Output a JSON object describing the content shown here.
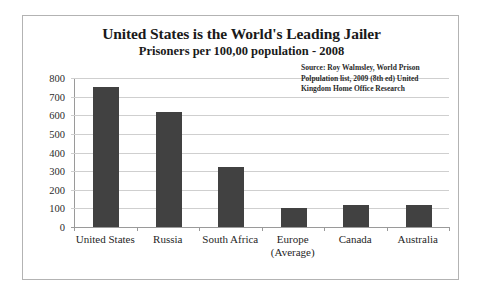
{
  "chart_data": {
    "type": "bar",
    "title": "United States is the World's Leading Jailer",
    "subtitle": "Prisoners per 100,00 population - 2008",
    "xlabel": "",
    "ylabel": "",
    "ylim": [
      0,
      800
    ],
    "yticks": [
      800,
      700,
      600,
      500,
      400,
      300,
      200,
      100,
      0
    ],
    "grid": true,
    "legend": "none",
    "bar_color": "#414141",
    "categories": [
      "United States",
      "Russia",
      "South Africa",
      "Europe (Average)",
      "Canada",
      "Australia"
    ],
    "category_lines": [
      [
        "United States"
      ],
      [
        "Russia"
      ],
      [
        "South Africa"
      ],
      [
        "Europe",
        "(Average)"
      ],
      [
        "Canada"
      ],
      [
        "Australia"
      ]
    ],
    "values": [
      750,
      620,
      320,
      100,
      116,
      118
    ],
    "annotations": {
      "source": [
        "Source: Roy Walmsley, World Prison",
        "Polpulation list, 2009 (8th ed) United",
        "Kingdom Home Office Research"
      ]
    }
  }
}
